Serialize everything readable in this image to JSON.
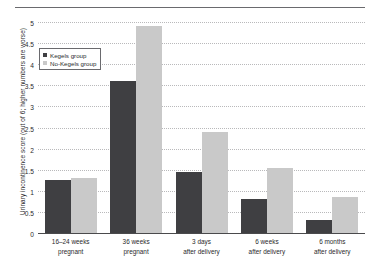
{
  "chart_data": {
    "type": "bar",
    "title": "",
    "xlabel": "",
    "ylabel": "Urinary incontinence score (out of 6; higher numbers are worse)",
    "ylim": [
      0,
      5
    ],
    "yticks": [
      "0",
      "0.5",
      "1",
      "1.5",
      "2",
      "2.5",
      "3",
      "3.5",
      "4",
      "4.5",
      "5"
    ],
    "ytick_values": [
      0,
      0.5,
      1,
      1.5,
      2,
      2.5,
      3,
      3.5,
      4,
      4.5,
      5
    ],
    "grid": true,
    "legend_position": "upper-left",
    "categories": [
      "16–24 weeks pregnant",
      "36 weeks pregnant",
      "3 days after delivery",
      "6 weeks after delivery",
      "6 months after delivery"
    ],
    "category_lines": [
      [
        "16–24 weeks",
        "pregnant"
      ],
      [
        "36 weeks",
        "pregnant"
      ],
      [
        "3 days",
        "after delivery"
      ],
      [
        "6 weeks",
        "after delivery"
      ],
      [
        "6 months",
        "after delivery"
      ]
    ],
    "series": [
      {
        "name": "Kegels group",
        "color": "#3f3f42",
        "values": [
          1.25,
          3.6,
          1.45,
          0.8,
          0.3
        ]
      },
      {
        "name": "No-Kegels group",
        "color": "#c9c9c9",
        "values": [
          1.3,
          4.9,
          2.4,
          1.55,
          0.85
        ]
      }
    ]
  },
  "legend": {
    "items": [
      {
        "label": "Kegels group",
        "swatch": "kegels"
      },
      {
        "label": "No-Kegels group",
        "swatch": "nokegels"
      }
    ]
  },
  "colors": {
    "kegels": "#3f3f42",
    "no_kegels": "#c9c9c9",
    "axis": "#4a4a4c",
    "grid": "#b9b9bb",
    "rule": "#6a6a6e"
  }
}
